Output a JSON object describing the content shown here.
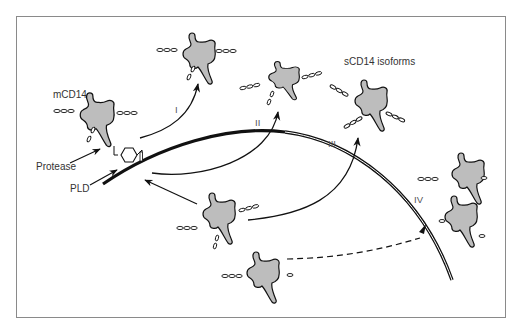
{
  "diagram": {
    "colors": {
      "molecule_fill": "#bdbdbd",
      "stroke": "#111111",
      "frame": "#8a8a8a",
      "text": "#333333"
    },
    "labels": {
      "mcd14": "mCD14",
      "protease": "Protease",
      "pld": "PLD",
      "scd14_isoforms": "sCD14 isoforms",
      "pathway_1": "I",
      "pathway_2": "II",
      "pathway_3": "III",
      "pathway_4": "IV"
    },
    "nodes": [
      {
        "id": "mCD14",
        "label": "mCD14",
        "type": "membrane-bound molecule with GPI anchor"
      },
      {
        "id": "iso-I",
        "label": "sCD14 (pathway I)",
        "type": "soluble molecule"
      },
      {
        "id": "iso-II",
        "label": "sCD14 (pathway II)",
        "type": "soluble molecule"
      },
      {
        "id": "iso-III",
        "label": "sCD14 (pathway III)",
        "type": "soluble molecule"
      },
      {
        "id": "iso-IV-a",
        "label": "sCD14 (pathway IV)",
        "type": "soluble molecule"
      },
      {
        "id": "iso-IV-b",
        "label": "sCD14 (pathway IV)",
        "type": "soluble molecule"
      },
      {
        "id": "intracellular-1",
        "type": "intracellular molecule"
      },
      {
        "id": "intracellular-2",
        "type": "intracellular molecule"
      },
      {
        "id": "membrane",
        "type": "cell membrane (curved line)"
      }
    ],
    "edges": [
      {
        "from": "Protease",
        "to": "mCD14",
        "style": "solid",
        "label": ""
      },
      {
        "from": "PLD",
        "to": "GPI anchor",
        "style": "solid",
        "label": ""
      },
      {
        "from": "mCD14",
        "to": "iso-I",
        "style": "solid-curved",
        "label": "I"
      },
      {
        "from": "membrane",
        "to": "iso-II",
        "style": "solid-curved",
        "label": "II"
      },
      {
        "from": "intracellular-1",
        "to": "membrane",
        "style": "solid",
        "label": ""
      },
      {
        "from": "intracellular-1",
        "to": "iso-III",
        "style": "solid-curved",
        "label": "III"
      },
      {
        "from": "intracellular-2",
        "to": "iso-IV",
        "style": "dashed",
        "label": "IV"
      }
    ]
  }
}
